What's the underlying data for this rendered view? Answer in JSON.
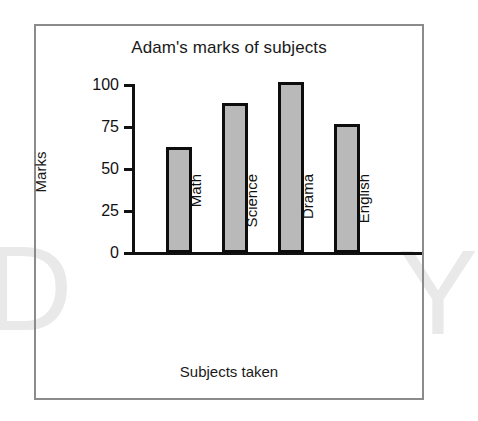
{
  "watermark": {
    "left_letter": "D",
    "right_letter": "Y"
  },
  "top_sliver_text": "",
  "chart_data": {
    "type": "bar",
    "title": "Adam's marks of subjects",
    "xlabel": "Subjects taken",
    "ylabel": "Marks",
    "categories": [
      "Math",
      "Science",
      "Drama",
      "English"
    ],
    "values": [
      63,
      89,
      102,
      77
    ],
    "ylim": [
      0,
      100
    ],
    "ytick_labels": [
      "0",
      "25",
      "50",
      "75",
      "100"
    ],
    "ytick_values": [
      0,
      25,
      50,
      75,
      100
    ],
    "grid": false,
    "legend": false,
    "bar_fill_color": "#b9b9b9",
    "bar_border_color": "#0d0d0d",
    "axis_color": "#111111",
    "frame_color": "#8b8b8b"
  }
}
